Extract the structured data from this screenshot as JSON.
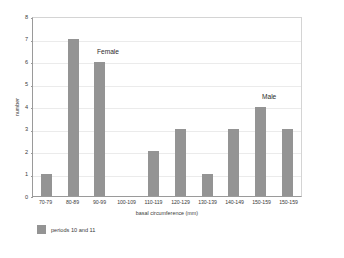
{
  "chart_data": {
    "type": "bar",
    "title": "",
    "categories": [
      "70-79",
      "80-89",
      "90-99",
      "100-109",
      "110-119",
      "120-129",
      "130-139",
      "140-149",
      "150-159",
      "150-159"
    ],
    "values": [
      1,
      7,
      6,
      0,
      2,
      3,
      1,
      3,
      4,
      3
    ],
    "series": [
      {
        "name": "periods 10 and 11",
        "values": [
          1,
          7,
          6,
          0,
          2,
          3,
          1,
          3,
          4,
          3
        ]
      }
    ],
    "xlabel": "basal circumference (mm)",
    "ylabel": "number",
    "ylim": [
      0,
      8
    ],
    "yticks": [
      0,
      1,
      2,
      3,
      4,
      5,
      6,
      7,
      8
    ],
    "ytick_labels": [
      "0",
      "1",
      "2",
      "3",
      "4",
      "5",
      "6",
      "7",
      "8"
    ],
    "grid": true,
    "legend_position": "below-left",
    "annotations": [
      {
        "text": "Female",
        "category": "90-99"
      },
      {
        "text": "Male",
        "category": "150-159"
      }
    ],
    "bar_color": "#949494",
    "grid_color": "#ebebeb",
    "axis_color": "#9a9a9a"
  },
  "legend": {
    "entries": [
      {
        "label": "periods 10 and 11",
        "color": "#949494"
      }
    ]
  },
  "annotations": {
    "female": "Female",
    "male": "Male"
  },
  "caption": ""
}
